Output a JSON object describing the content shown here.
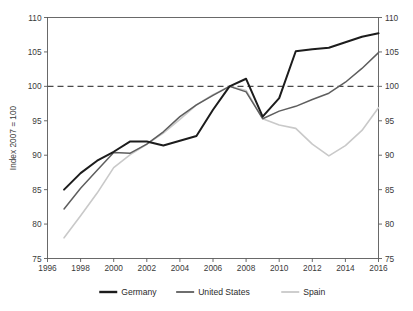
{
  "chart_data": {
    "type": "line",
    "title": "",
    "subtitle": "",
    "xlabel": "",
    "ylabel": "Index 2007 = 100",
    "xlim": [
      1996,
      2016
    ],
    "ylim": [
      75,
      110
    ],
    "xticks": [
      1996,
      1998,
      2000,
      2002,
      2004,
      2006,
      2008,
      2010,
      2012,
      2014,
      2016
    ],
    "yticks": [
      75,
      80,
      85,
      90,
      95,
      100,
      105,
      110
    ],
    "xtick_labels": [
      "1996",
      "1998",
      "2000",
      "2002",
      "2004",
      "2006",
      "2008",
      "2010",
      "2012",
      "2014",
      "2016"
    ],
    "ytick_labels": [
      "75",
      "80",
      "85",
      "90",
      "95",
      "100",
      "105",
      "110"
    ],
    "grid": false,
    "right_axis": true,
    "right_ytick_labels": [
      "75",
      "80",
      "85",
      "90",
      "95",
      "100",
      "105",
      "110"
    ],
    "legend_position": "bottom",
    "annotations": [
      {
        "type": "hline",
        "y": 100,
        "style": "dashed",
        "color": "#4a4a4a",
        "label": ""
      }
    ],
    "x": [
      1997,
      1998,
      1999,
      2000,
      2001,
      2002,
      2003,
      2004,
      2005,
      2006,
      2007,
      2008,
      2009,
      2010,
      2011,
      2012,
      2013,
      2014,
      2015,
      2016
    ],
    "series": [
      {
        "name": "Germany",
        "color": "#1c1c1c",
        "width": 2.0,
        "values": [
          85.0,
          87.4,
          89.2,
          90.5,
          92.0,
          92.0,
          91.4,
          92.1,
          92.8,
          96.6,
          100.0,
          101.1,
          95.6,
          98.3,
          105.1,
          105.4,
          105.6,
          106.4,
          107.2,
          107.7
        ]
      },
      {
        "name": "United States",
        "color": "#5e5e5e",
        "width": 1.5,
        "values": [
          82.2,
          85.2,
          87.8,
          90.4,
          90.3,
          91.6,
          93.4,
          95.6,
          97.3,
          98.7,
          100.0,
          99.2,
          95.3,
          96.4,
          97.1,
          98.1,
          99.0,
          100.6,
          102.6,
          104.9
        ]
      },
      {
        "name": "Spain",
        "color": "#c9c9c9",
        "width": 1.6,
        "values": [
          78.0,
          81.2,
          84.5,
          88.2,
          90.1,
          91.6,
          93.2,
          95.2,
          97.3,
          98.8,
          100.0,
          99.4,
          95.3,
          94.4,
          93.9,
          91.6,
          89.9,
          91.4,
          93.6,
          96.9
        ]
      }
    ],
    "legend": [
      {
        "label": "Germany",
        "color": "#1c1c1c",
        "width": 2.4
      },
      {
        "label": "United States",
        "color": "#5e5e5e",
        "width": 1.8
      },
      {
        "label": "Spain",
        "color": "#c9c9c9",
        "width": 1.8
      }
    ]
  }
}
